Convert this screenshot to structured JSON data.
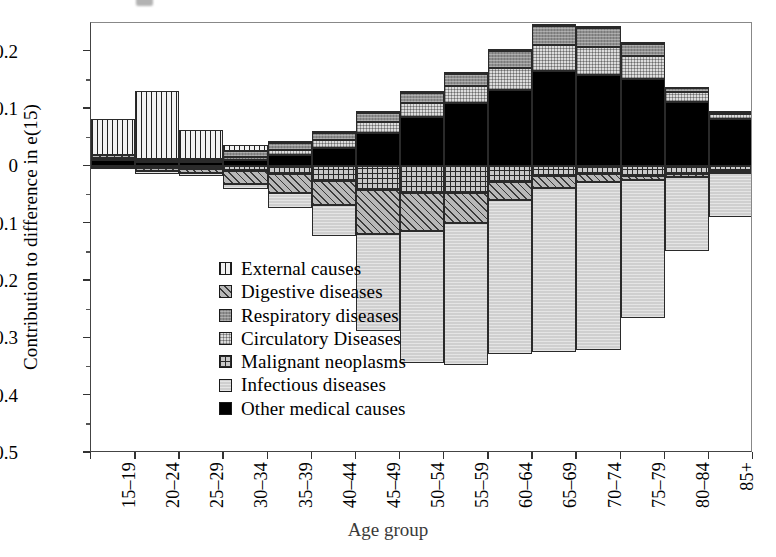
{
  "chart_data": {
    "type": "bar",
    "stacked": true,
    "title": "",
    "xlabel": "Age group",
    "ylabel": "Contribution to difference in e(15)",
    "ylim": [
      -0.5,
      0.25
    ],
    "yticks": [
      "0.2",
      "0.1",
      "0",
      "–0.1",
      "–0.2",
      "–0.3",
      "–0.4",
      "–0.5"
    ],
    "ytick_values": [
      0.2,
      0.1,
      0,
      -0.1,
      -0.2,
      -0.3,
      -0.4,
      -0.5
    ],
    "grid": false,
    "legend_position": "inside-left",
    "categories": [
      "15–19",
      "20–24",
      "25–29",
      "30–34",
      "35–39",
      "40–44",
      "45–49",
      "50–54",
      "55–59",
      "60–64",
      "65–69",
      "70–74",
      "75–79",
      "80–84",
      "85+"
    ],
    "series": [
      {
        "name": "External causes",
        "pattern": "vertical-lines",
        "values": [
          0.063,
          0.118,
          0.05,
          0.011,
          0.005,
          0.004,
          0.004,
          0.004,
          0.003,
          0.003,
          0.004,
          0.003,
          0.003,
          0.003,
          0.002
        ]
      },
      {
        "name": "Digestive diseases",
        "pattern": "diagonal-hatch",
        "values": [
          0.004,
          -0.006,
          -0.008,
          -0.022,
          -0.032,
          -0.042,
          -0.077,
          -0.067,
          -0.052,
          -0.03,
          -0.022,
          -0.014,
          -0.008,
          -0.005,
          -0.003
        ]
      },
      {
        "name": "Respiratory diseases",
        "pattern": "solid-mid-gray",
        "values": [
          0.002,
          0.002,
          0.003,
          0.01,
          0.011,
          0.012,
          0.015,
          0.018,
          0.021,
          0.029,
          0.033,
          0.033,
          0.022,
          0.006,
          0.004
        ]
      },
      {
        "name": "Circulatory Diseases",
        "pattern": "fine-crosshatch",
        "values": [
          0.002,
          0.003,
          0.003,
          0.006,
          0.01,
          0.014,
          0.02,
          0.024,
          0.03,
          0.038,
          0.044,
          0.048,
          0.04,
          0.018,
          0.009
        ]
      },
      {
        "name": "Malignant neoplasms",
        "pattern": "grid-lines",
        "values": [
          -0.002,
          -0.003,
          -0.004,
          -0.008,
          -0.014,
          -0.026,
          -0.041,
          -0.046,
          -0.046,
          -0.028,
          -0.016,
          -0.013,
          -0.016,
          -0.013,
          -0.009
        ]
      },
      {
        "name": "Infectious diseases",
        "pattern": "light-stipple",
        "values": [
          -0.003,
          -0.004,
          -0.005,
          -0.01,
          -0.026,
          -0.054,
          -0.17,
          -0.23,
          -0.248,
          -0.27,
          -0.286,
          -0.294,
          -0.24,
          -0.13,
          -0.076
        ]
      },
      {
        "name": "Other medical causes",
        "pattern": "solid-black",
        "values": [
          0.011,
          0.008,
          0.007,
          0.011,
          0.019,
          0.032,
          0.058,
          0.086,
          0.11,
          0.134,
          0.167,
          0.16,
          0.152,
          0.112,
          0.082
        ]
      }
    ]
  },
  "legend": {
    "items": [
      {
        "label": "External causes"
      },
      {
        "label": "Digestive diseases"
      },
      {
        "label": "Respiratory diseases"
      },
      {
        "label": "Circulatory Diseases"
      },
      {
        "label": "Malignant neoplasms"
      },
      {
        "label": "Infectious diseases"
      },
      {
        "label": "Other medical causes"
      }
    ]
  }
}
